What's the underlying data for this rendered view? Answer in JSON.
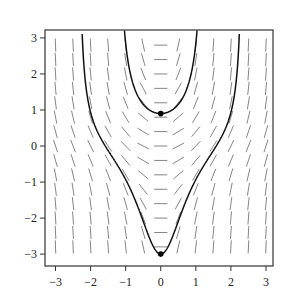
{
  "chart_data": {
    "type": "line",
    "subtype": "slope-field-with-solution-curves",
    "title": "",
    "xlabel": "",
    "ylabel": "",
    "xlim": [
      -3.3,
      3.2
    ],
    "ylim": [
      -3.33,
      3.22
    ],
    "grid": false,
    "legend": null,
    "x_ticks": [
      -3,
      -2,
      -1,
      0,
      1,
      2,
      3
    ],
    "y_ticks": [
      -3,
      -2,
      -1,
      0,
      1,
      2,
      3
    ],
    "x_tick_labels": [
      "−3",
      "−2",
      "−1",
      "0",
      "1",
      "2",
      "3"
    ],
    "y_tick_labels": [
      "−3",
      "−2",
      "−1",
      "0",
      "1",
      "2",
      "3"
    ],
    "slope_field": {
      "equation": "dy/dx = x(1 + y^2)",
      "x_range": [
        -3,
        3
      ],
      "x_step": 0.5,
      "y_range": [
        -2.8,
        2.8
      ],
      "y_step": 0.4,
      "dash_length": 0.22
    },
    "series": [
      {
        "name": "solution through (0, 0.9)",
        "C": 0.733,
        "x": [
          -1.0,
          -0.9,
          -0.75,
          -0.5,
          -0.25,
          0,
          0.25,
          0.5,
          0.75,
          0.9,
          1.0
        ],
        "y": [
          2.85,
          2.15,
          1.61,
          1.16,
          0.957,
          0.9,
          0.957,
          1.16,
          1.61,
          2.15,
          2.85
        ]
      },
      {
        "name": "solution through (0, -3)",
        "C": -1.249,
        "x": [
          -2.2,
          -2.0,
          -1.5,
          -1.0,
          -0.5,
          0,
          0.5,
          1.0,
          1.5,
          2.0,
          2.2
        ],
        "y": [
          2.37,
          0.93,
          -0.125,
          -0.93,
          -2.08,
          -3.0,
          -2.08,
          -0.93,
          -0.125,
          0.93,
          2.37
        ]
      }
    ],
    "points": [
      {
        "x": 0,
        "y": 0.9
      },
      {
        "x": 0,
        "y": -3
      }
    ]
  }
}
